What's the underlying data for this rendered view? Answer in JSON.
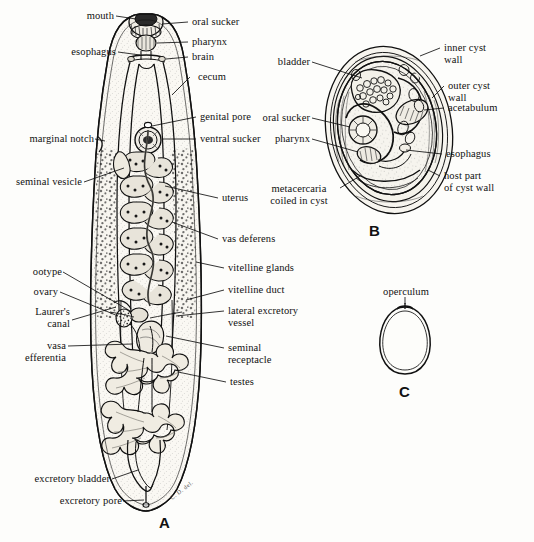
{
  "figure": {
    "type": "scientific-illustration",
    "panels": [
      {
        "id": "A",
        "letter": "A",
        "caption": "adult fluke, ventral view"
      },
      {
        "id": "B",
        "letter": "B",
        "caption": "metacercaria encysted"
      },
      {
        "id": "C",
        "letter": "C",
        "caption": "egg with operculum"
      }
    ],
    "artist_signature": "C. D. del."
  },
  "panel_a": {
    "letter": "A",
    "labels_left": [
      {
        "key": "mouth",
        "text": "mouth"
      },
      {
        "key": "esophagus",
        "text": "esophagus"
      },
      {
        "key": "marginal_notch",
        "text": "marginal notch"
      },
      {
        "key": "seminal_vesicle",
        "text": "seminal vesicle"
      },
      {
        "key": "ootype",
        "text": "ootype"
      },
      {
        "key": "ovary",
        "text": "ovary"
      },
      {
        "key": "laurers_canal",
        "text": "Laurer's\ncanal"
      },
      {
        "key": "vasa_efferentia",
        "text": "vasa\nefferentia"
      },
      {
        "key": "excretory_bladder",
        "text": "excretory bladder"
      },
      {
        "key": "excretory_pore",
        "text": "excretory pore"
      }
    ],
    "labels_right": [
      {
        "key": "oral_sucker",
        "text": "oral sucker"
      },
      {
        "key": "pharynx",
        "text": "pharynx"
      },
      {
        "key": "brain",
        "text": "brain"
      },
      {
        "key": "cecum",
        "text": "cecum"
      },
      {
        "key": "genital_pore",
        "text": "genital pore"
      },
      {
        "key": "ventral_sucker",
        "text": "ventral sucker"
      },
      {
        "key": "uterus",
        "text": "uterus"
      },
      {
        "key": "vas_deferens",
        "text": "vas deferens"
      },
      {
        "key": "vitelline_glands",
        "text": "vitelline glands"
      },
      {
        "key": "vitelline_duct",
        "text": "vitelline duct"
      },
      {
        "key": "lateral_excretory_vessel",
        "text": "lateral excretory\nvessel"
      },
      {
        "key": "seminal_receptacle",
        "text": "seminal\nreceptacle"
      },
      {
        "key": "testes",
        "text": "testes"
      }
    ]
  },
  "panel_b": {
    "letter": "B",
    "labels_left": [
      {
        "key": "bladder",
        "text": "bladder"
      },
      {
        "key": "oral_sucker",
        "text": "oral sucker"
      },
      {
        "key": "pharynx",
        "text": "pharynx"
      },
      {
        "key": "metacercaria_coiled",
        "text": "metacercaria\ncoiled in cyst"
      }
    ],
    "labels_right": [
      {
        "key": "inner_cyst_wall",
        "text": "inner cyst\nwall"
      },
      {
        "key": "outer_cyst_wall",
        "text": "outer cyst\nwall"
      },
      {
        "key": "acetabulum",
        "text": "acetabulum"
      },
      {
        "key": "esophagus",
        "text": "esophagus"
      },
      {
        "key": "host_part_of_cyst_wall",
        "text": "host part\nof cyst wall"
      }
    ]
  },
  "panel_c": {
    "letter": "C",
    "labels": [
      {
        "key": "operculum",
        "text": "operculum"
      }
    ]
  },
  "colors": {
    "ink": "#111111",
    "paper": "#fdfdfb",
    "tissue_fill": "#f4f2ec",
    "stipple": "#2b2b2b"
  }
}
